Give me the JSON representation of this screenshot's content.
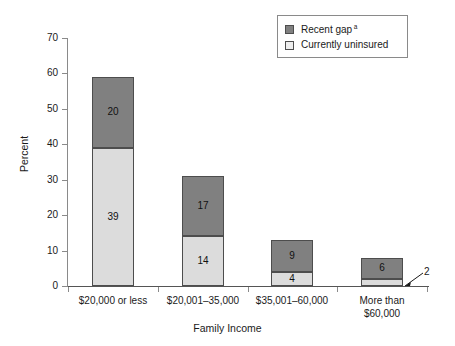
{
  "chart_data": {
    "type": "bar",
    "subtype": "stacked-bar",
    "title": "",
    "xlabel": "Family Income",
    "ylabel": "Percent",
    "ylim": [
      0,
      70
    ],
    "yticks": [
      0,
      10,
      20,
      30,
      40,
      50,
      60,
      70
    ],
    "grid": false,
    "categories": [
      "$20,000 or less",
      "$20,001–35,000",
      "$35,001–60,000",
      "More than\n$60,000"
    ],
    "series": [
      {
        "name": "Currently uninsured",
        "color": "#dcdcdc",
        "values": [
          39,
          14,
          4,
          2
        ]
      },
      {
        "name": "Recent gap",
        "color": "#808080",
        "values": [
          20,
          17,
          9,
          6
        ]
      }
    ],
    "totals": [
      59,
      31,
      13,
      8
    ],
    "annotations": [
      {
        "text": "2",
        "for_category": "More than $60,000",
        "for_series": "Currently uninsured",
        "style": "leader-line-callout"
      }
    ],
    "legend": {
      "position": "top-right",
      "entries": [
        {
          "label": "Recent gap",
          "superscript": "a",
          "color": "#808080"
        },
        {
          "label": "Currently uninsured",
          "superscript": "",
          "color": "#eeeeee"
        }
      ]
    }
  },
  "colors": {
    "dark_gray": "#808080",
    "light_gray": "#dcdcdc",
    "legend_light": "#eeeeee",
    "axis": "#8a8a8a",
    "text": "#1a1a1a",
    "background": "#ffffff"
  }
}
